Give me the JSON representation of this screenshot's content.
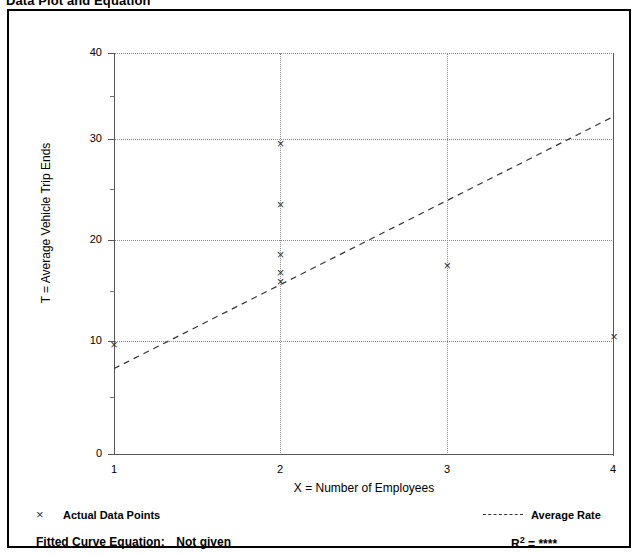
{
  "page": {
    "title": "Data Plot and Equation"
  },
  "chart_data": {
    "type": "scatter",
    "title": "Data Plot and Equation",
    "xlabel": "X = Number of Employees",
    "ylabel": "T = Average Vehicle Trip Ends",
    "xlim": [
      1,
      4
    ],
    "ylim": [
      0,
      40
    ],
    "xticks": [
      1,
      2,
      3,
      4
    ],
    "yticks": [
      0,
      10,
      20,
      30,
      40
    ],
    "yminor_ticks": [
      5,
      15,
      25,
      35
    ],
    "grid": true,
    "legend_position": "below-plot",
    "series": [
      {
        "name": "Actual Data Points",
        "type": "scatter",
        "marker": "x",
        "points": [
          {
            "x": 1,
            "y": 11.0
          },
          {
            "x": 2,
            "y": 31.0
          },
          {
            "x": 2,
            "y": 24.9
          },
          {
            "x": 2,
            "y": 20.0
          },
          {
            "x": 2,
            "y": 18.2
          },
          {
            "x": 2,
            "y": 17.3
          },
          {
            "x": 3,
            "y": 18.9
          },
          {
            "x": 4,
            "y": 11.8
          }
        ]
      },
      {
        "name": "Average Rate",
        "type": "line",
        "style": "dashed",
        "endpoints": [
          {
            "x": 1,
            "y": 8.6
          },
          {
            "x": 4,
            "y": 33.7
          }
        ]
      }
    ]
  },
  "axes": {
    "y_title": "T = Average Vehicle Trip Ends",
    "x_title": "X = Number of Employees",
    "y_tick_labels": [
      "0",
      "10",
      "20",
      "30",
      "40"
    ],
    "x_tick_labels": [
      "1",
      "2",
      "3",
      "4"
    ]
  },
  "legend": {
    "data_points_label": "Actual Data Points",
    "average_rate_label": "Average Rate",
    "marker_glyph": "×"
  },
  "footer": {
    "equation_label": "Fitted Curve Equation:",
    "equation_value": "Not given",
    "r_squared_label": "R",
    "r_squared_exponent": "2",
    "r_squared_equals": "=",
    "r_squared_value": "****"
  },
  "colors": {
    "frame": "#000000",
    "axis": "#555555",
    "grid": "#8a8a8a",
    "marker": "#333333",
    "trend": "#333333",
    "background": "#ffffff"
  }
}
